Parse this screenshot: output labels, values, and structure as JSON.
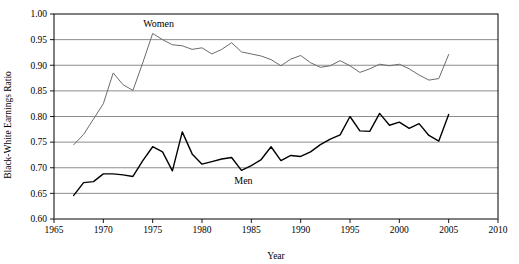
{
  "chart_data": {
    "type": "line",
    "title": "",
    "xlabel": "Year",
    "ylabel": "Black-White Earnings Ratio",
    "xlim": [
      1965,
      2010
    ],
    "ylim": [
      0.6,
      1.0
    ],
    "xticks": [
      1965,
      1970,
      1975,
      1980,
      1985,
      1990,
      1995,
      2000,
      2005,
      2010
    ],
    "xtick_labels": [
      "1965",
      "1970",
      "1975",
      "1980",
      "1985",
      "1990",
      "1995",
      "2000",
      "2005",
      "2010"
    ],
    "yticks": [
      0.6,
      0.65,
      0.7,
      0.75,
      0.8,
      0.85,
      0.9,
      0.95,
      1.0
    ],
    "ytick_labels": [
      "0.60",
      "0.65",
      "0.70",
      "0.75",
      "0.80",
      "0.85",
      "0.90",
      "0.95",
      "1.00"
    ],
    "grid": "horizontal",
    "legend_position": "inline-annotations",
    "series": [
      {
        "name": "Women",
        "color": "#6b6b6b",
        "linewidth": 1,
        "annotation": "Women",
        "annotation_x": 1975.6,
        "annotation_y": 0.975,
        "x": [
          1967,
          1968,
          1969,
          1970,
          1971,
          1972,
          1973,
          1974,
          1975,
          1976,
          1977,
          1978,
          1979,
          1980,
          1981,
          1982,
          1983,
          1984,
          1985,
          1986,
          1987,
          1988,
          1989,
          1990,
          1991,
          1992,
          1993,
          1994,
          1995,
          1996,
          1997,
          1998,
          1999,
          2000,
          2001,
          2002,
          2003,
          2004,
          2005
        ],
        "values": [
          0.745,
          0.765,
          0.795,
          0.825,
          0.885,
          0.862,
          0.851,
          0.905,
          0.962,
          0.95,
          0.94,
          0.938,
          0.931,
          0.934,
          0.922,
          0.931,
          0.944,
          0.926,
          0.922,
          0.918,
          0.911,
          0.899,
          0.912,
          0.919,
          0.905,
          0.896,
          0.899,
          0.909,
          0.899,
          0.886,
          0.893,
          0.902,
          0.899,
          0.902,
          0.893,
          0.881,
          0.871,
          0.874,
          0.921
        ]
      },
      {
        "name": "Men",
        "color": "#000000",
        "linewidth": 1.4,
        "annotation": "Men",
        "annotation_x": 1984.2,
        "annotation_y": 0.668,
        "x": [
          1967,
          1968,
          1969,
          1970,
          1971,
          1972,
          1973,
          1974,
          1975,
          1976,
          1977,
          1978,
          1979,
          1980,
          1981,
          1982,
          1983,
          1984,
          1985,
          1986,
          1987,
          1988,
          1989,
          1990,
          1991,
          1992,
          1993,
          1994,
          1995,
          1996,
          1997,
          1998,
          1999,
          2000,
          2001,
          2002,
          2003,
          2004,
          2005
        ],
        "values": [
          0.646,
          0.671,
          0.673,
          0.688,
          0.688,
          0.686,
          0.683,
          0.714,
          0.741,
          0.731,
          0.694,
          0.77,
          0.727,
          0.707,
          0.712,
          0.717,
          0.72,
          0.695,
          0.704,
          0.716,
          0.741,
          0.714,
          0.724,
          0.722,
          0.731,
          0.745,
          0.756,
          0.764,
          0.8,
          0.772,
          0.771,
          0.806,
          0.783,
          0.789,
          0.777,
          0.786,
          0.763,
          0.752,
          0.804
        ]
      }
    ]
  }
}
